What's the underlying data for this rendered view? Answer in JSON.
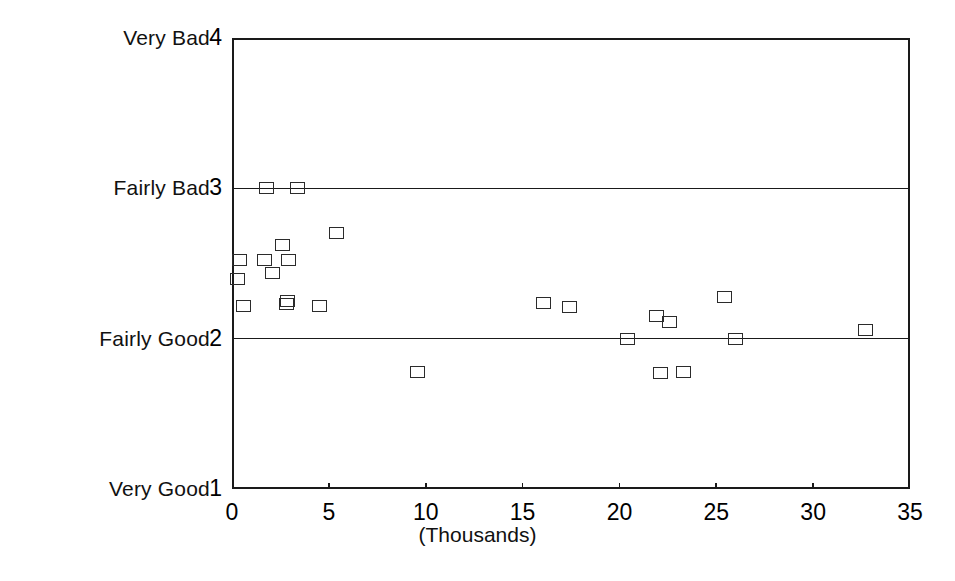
{
  "chart_data": {
    "type": "scatter",
    "title": "",
    "subtitle": "",
    "xlabel": "(Thousands)",
    "ylabel": "",
    "xlim": [
      0,
      35
    ],
    "ylim": [
      1,
      4
    ],
    "grid": "horizontal-at-y2-and-y3",
    "legend": "none",
    "marker": "open-square",
    "marker_color": "#2b2b2b",
    "x_ticks": [
      0,
      5,
      10,
      15,
      20,
      25,
      30,
      35
    ],
    "x_tick_labels": [
      "0",
      "5",
      "10",
      "15",
      "20",
      "25",
      "30",
      "35"
    ],
    "y_ticks": [
      1,
      2,
      3,
      4
    ],
    "y_tick_labels": [
      "1",
      "2",
      "3",
      "4"
    ],
    "y_category_labels": [
      {
        "value": 4,
        "label": "Very Bad"
      },
      {
        "value": 3,
        "label": "Fairly Bad"
      },
      {
        "value": 2,
        "label": "Fairly Good"
      },
      {
        "value": 1,
        "label": "Very Good"
      }
    ],
    "points": [
      {
        "x": 0.3,
        "y": 2.4
      },
      {
        "x": 0.4,
        "y": 2.52
      },
      {
        "x": 0.6,
        "y": 2.22
      },
      {
        "x": 1.7,
        "y": 2.52
      },
      {
        "x": 1.8,
        "y": 3.0
      },
      {
        "x": 2.1,
        "y": 2.44
      },
      {
        "x": 2.6,
        "y": 2.62
      },
      {
        "x": 2.8,
        "y": 2.23
      },
      {
        "x": 2.85,
        "y": 2.25
      },
      {
        "x": 2.9,
        "y": 2.52
      },
      {
        "x": 3.4,
        "y": 3.0
      },
      {
        "x": 4.5,
        "y": 2.22
      },
      {
        "x": 5.4,
        "y": 2.7
      },
      {
        "x": 9.6,
        "y": 1.78
      },
      {
        "x": 16.1,
        "y": 2.24
      },
      {
        "x": 17.4,
        "y": 2.21
      },
      {
        "x": 20.4,
        "y": 2.0
      },
      {
        "x": 21.9,
        "y": 2.15
      },
      {
        "x": 22.1,
        "y": 1.77
      },
      {
        "x": 22.6,
        "y": 2.11
      },
      {
        "x": 23.3,
        "y": 1.78
      },
      {
        "x": 25.4,
        "y": 2.28
      },
      {
        "x": 26.0,
        "y": 2.0
      },
      {
        "x": 32.7,
        "y": 2.06
      }
    ]
  }
}
